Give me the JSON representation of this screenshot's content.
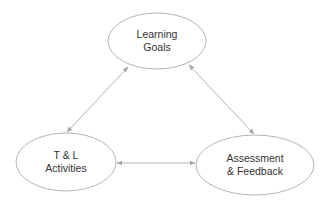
{
  "diagram": {
    "type": "cycle-triangle",
    "colors": {
      "background": "#ffffff",
      "stroke": "#b4b4b4",
      "text": "#333333"
    },
    "nodes": [
      {
        "id": "learning-goals",
        "lines": [
          "Learning",
          "Goals"
        ],
        "cx": 157,
        "cy": 41,
        "rx": 49,
        "ry": 28
      },
      {
        "id": "tl-activities",
        "lines": [
          "T & L",
          "Activities"
        ],
        "cx": 66,
        "cy": 162,
        "rx": 50,
        "ry": 29
      },
      {
        "id": "assessment-feedback",
        "lines": [
          "Assessment",
          "& Feedback"
        ],
        "cx": 255,
        "cy": 165,
        "rx": 59,
        "ry": 30
      }
    ],
    "edges": [
      {
        "from": "learning-goals",
        "to": "tl-activities",
        "direction": "both",
        "x1": 128,
        "y1": 67,
        "x2": 67,
        "y2": 132
      },
      {
        "from": "learning-goals",
        "to": "assessment-feedback",
        "direction": "both",
        "x1": 189,
        "y1": 65,
        "x2": 254,
        "y2": 134
      },
      {
        "from": "tl-activities",
        "to": "assessment-feedback",
        "direction": "both",
        "x1": 117,
        "y1": 163,
        "x2": 195,
        "y2": 163
      }
    ]
  }
}
